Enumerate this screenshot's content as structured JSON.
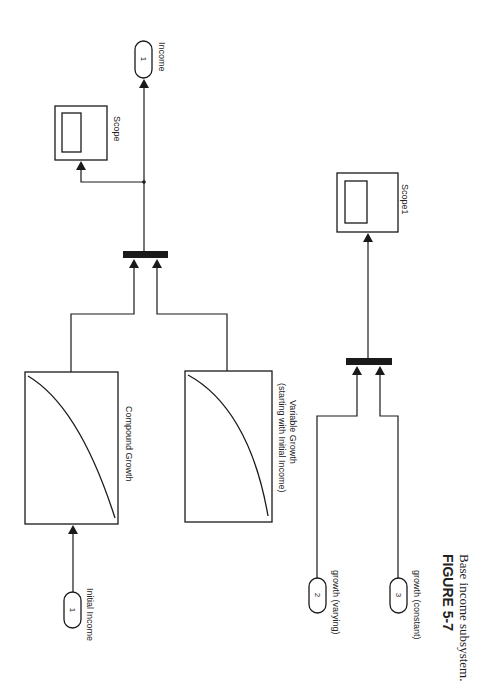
{
  "diagram": {
    "outports": [
      {
        "id": "income",
        "number": "1",
        "label": "Income"
      }
    ],
    "inports": [
      {
        "id": "initial_income",
        "number": "1",
        "label": "Initial Income"
      },
      {
        "id": "growth_varying",
        "number": "2",
        "label": "growth (varying)"
      },
      {
        "id": "growth_constant",
        "number": "3",
        "label": "growth (constant)"
      }
    ],
    "scopes": [
      {
        "id": "scope",
        "label": "Scope"
      },
      {
        "id": "scope1",
        "label": "Scope1"
      }
    ],
    "lookup_blocks": [
      {
        "id": "compound_growth",
        "label": "Compound Growth"
      },
      {
        "id": "variable_growth",
        "label_line1": "Variable Growth",
        "label_line2": "(starting with Initial Income)"
      }
    ],
    "muxes": [
      {
        "id": "mux_income"
      },
      {
        "id": "mux_growth"
      }
    ]
  },
  "caption": {
    "figure_number": "FIGURE 5-7",
    "text": "Base income subsystem."
  },
  "colors": {
    "line": "#1a1a1a",
    "background": "#ffffff"
  }
}
